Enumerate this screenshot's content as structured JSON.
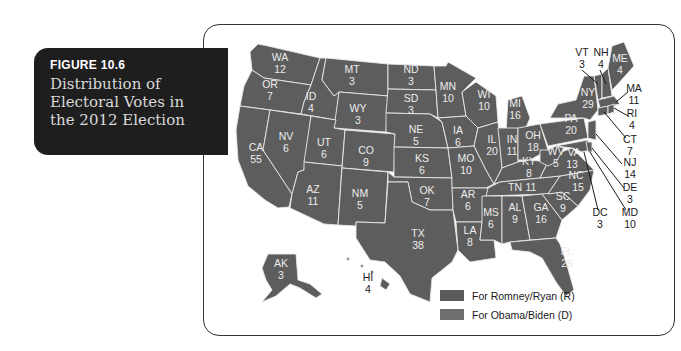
{
  "caption": {
    "figure_number": "FIGURE 10.6",
    "title": "Distribution of Electoral Votes in the 2012 Election"
  },
  "legend": [
    {
      "label": "For Romney/Ryan (R)",
      "color": "#5a5a5a"
    },
    {
      "label": "For Obama/Biden (D)",
      "color": "#6e6e6e"
    }
  ],
  "states": [
    {
      "abbr": "WA",
      "votes": "12"
    },
    {
      "abbr": "OR",
      "votes": "7"
    },
    {
      "abbr": "CA",
      "votes": "55"
    },
    {
      "abbr": "ID",
      "votes": "4"
    },
    {
      "abbr": "NV",
      "votes": "6"
    },
    {
      "abbr": "MT",
      "votes": "3"
    },
    {
      "abbr": "WY",
      "votes": "3"
    },
    {
      "abbr": "UT",
      "votes": "6"
    },
    {
      "abbr": "AZ",
      "votes": "11"
    },
    {
      "abbr": "CO",
      "votes": "9"
    },
    {
      "abbr": "NM",
      "votes": "5"
    },
    {
      "abbr": "ND",
      "votes": "3"
    },
    {
      "abbr": "SD",
      "votes": "3"
    },
    {
      "abbr": "NE",
      "votes": "5"
    },
    {
      "abbr": "KS",
      "votes": "6"
    },
    {
      "abbr": "OK",
      "votes": "7"
    },
    {
      "abbr": "TX",
      "votes": "38"
    },
    {
      "abbr": "MN",
      "votes": "10"
    },
    {
      "abbr": "IA",
      "votes": "6"
    },
    {
      "abbr": "MO",
      "votes": "10"
    },
    {
      "abbr": "AR",
      "votes": "6"
    },
    {
      "abbr": "LA",
      "votes": "8"
    },
    {
      "abbr": "WI",
      "votes": "10"
    },
    {
      "abbr": "IL",
      "votes": "20"
    },
    {
      "abbr": "MI",
      "votes": "16"
    },
    {
      "abbr": "IN",
      "votes": "11"
    },
    {
      "abbr": "OH",
      "votes": "18"
    },
    {
      "abbr": "KY",
      "votes": "8"
    },
    {
      "abbr": "TN",
      "votes": "11"
    },
    {
      "abbr": "MS",
      "votes": "6"
    },
    {
      "abbr": "AL",
      "votes": "9"
    },
    {
      "abbr": "GA",
      "votes": "16"
    },
    {
      "abbr": "FL",
      "votes": "29"
    },
    {
      "abbr": "SC",
      "votes": "9"
    },
    {
      "abbr": "NC",
      "votes": "15"
    },
    {
      "abbr": "VA",
      "votes": "13"
    },
    {
      "abbr": "WV",
      "votes": "5"
    },
    {
      "abbr": "PA",
      "votes": "20"
    },
    {
      "abbr": "NY",
      "votes": "29"
    },
    {
      "abbr": "VT",
      "votes": "3"
    },
    {
      "abbr": "NH",
      "votes": "4"
    },
    {
      "abbr": "ME",
      "votes": "4"
    },
    {
      "abbr": "MA",
      "votes": "11"
    },
    {
      "abbr": "RI",
      "votes": "4"
    },
    {
      "abbr": "CT",
      "votes": "7"
    },
    {
      "abbr": "NJ",
      "votes": "14"
    },
    {
      "abbr": "DE",
      "votes": "3"
    },
    {
      "abbr": "MD",
      "votes": "10"
    },
    {
      "abbr": "DC",
      "votes": "3"
    },
    {
      "abbr": "AK",
      "votes": "3"
    },
    {
      "abbr": "HI",
      "votes": "4"
    }
  ]
}
